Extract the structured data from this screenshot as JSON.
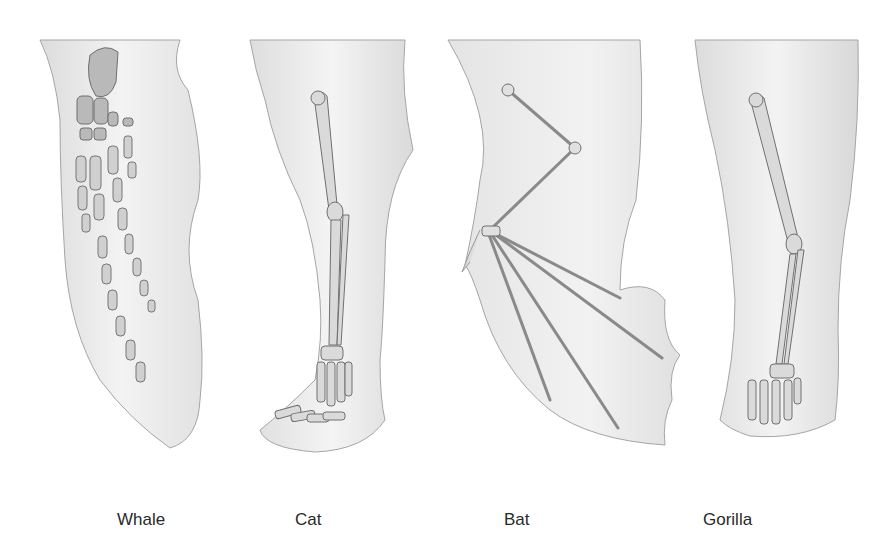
{
  "figure": {
    "panels": [
      {
        "id": "whale",
        "label": "Whale"
      },
      {
        "id": "cat",
        "label": "Cat"
      },
      {
        "id": "bat",
        "label": "Bat"
      },
      {
        "id": "gorilla",
        "label": "Gorilla"
      }
    ]
  },
  "colors": {
    "background": "#ffffff",
    "skin": "#ececec",
    "skin_shadow": "#d4d4d4",
    "outline": "#9a9a9a",
    "bone": "#cfcfcf",
    "bone_outline": "#6f6f6f",
    "label": "#2a2a2a"
  }
}
